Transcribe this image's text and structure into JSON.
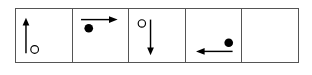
{
  "figure": {
    "type": "sequence-grid",
    "cells": [
      {
        "index": 1,
        "circle": "open",
        "circle_position": "bottom-right",
        "arrow": "up",
        "arrow_position": "left"
      },
      {
        "index": 2,
        "circle": "filled",
        "circle_position": "top-left",
        "arrow": "right",
        "arrow_position": "top"
      },
      {
        "index": 3,
        "circle": "open",
        "circle_position": "top-left",
        "arrow": "down",
        "arrow_position": "right"
      },
      {
        "index": 4,
        "circle": "filled",
        "circle_position": "bottom-right",
        "arrow": "left",
        "arrow_position": "bottom"
      },
      {
        "index": 5,
        "circle": "none",
        "arrow": "none",
        "note": "empty cell"
      }
    ],
    "colors": {
      "stroke": "#000000",
      "border": "#555555",
      "background": "#ffffff"
    }
  }
}
